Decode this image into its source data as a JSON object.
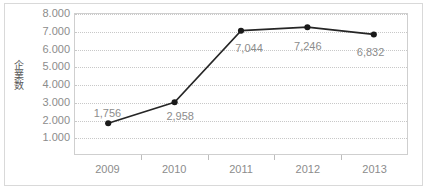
{
  "chart_data": {
    "type": "line",
    "title": "",
    "subtitle": "",
    "xlabel": "",
    "ylabel": "企業数",
    "categories": [
      "2009",
      "2010",
      "2011",
      "2012",
      "2013"
    ],
    "values": [
      1756,
      2958,
      7044,
      7246,
      6832
    ],
    "point_labels": [
      "1,756",
      "2,958",
      "7,044",
      "7,246",
      "6,832"
    ],
    "series": [
      {
        "name": "企業数",
        "values": [
          1756,
          2958,
          7044,
          7246,
          6832
        ]
      }
    ],
    "ylim": [
      0,
      8000
    ],
    "y_tick_values": [
      8000,
      7000,
      6000,
      5000,
      4000,
      3000,
      2000,
      1000
    ],
    "y_tick_labels": [
      "8.000",
      "7.000",
      "6.000",
      "5.000",
      "4.000",
      "3.000",
      "2.000",
      "1.000"
    ],
    "grid": true,
    "grid_style": "dotted-horizontal",
    "legend": false,
    "legend_position": "none",
    "marker": "circle",
    "colors": {
      "line": "#262626",
      "marker": "#1a1a1a",
      "gridline": "#c8c8c8",
      "axis": "#cfcfcf",
      "tick_text": "#8c8c8c",
      "data_label": "#8c8c8c",
      "frame": "#d9d9d9",
      "background": "#ffffff"
    },
    "label_offsets": [
      {
        "category": "2009",
        "dx": 0,
        "dy": -17,
        "align": "above"
      },
      {
        "category": "2010",
        "dx": 6,
        "dy": 8,
        "align": "below"
      },
      {
        "category": "2011",
        "dx": 8,
        "dy": 12,
        "align": "below"
      },
      {
        "category": "2012",
        "dx": 0,
        "dy": 14,
        "align": "below"
      },
      {
        "category": "2013",
        "dx": -4,
        "dy": 12,
        "align": "below"
      }
    ]
  }
}
